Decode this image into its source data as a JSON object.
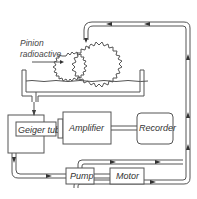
{
  "diagram": {
    "type": "schematic",
    "labels": {
      "pinion": "Pinion",
      "radioactive": "radioactive",
      "geiger": "Geiger tube",
      "amplifier": "Amplifier",
      "recorder": "Recorder",
      "pump": "Pump",
      "motor": "Motor"
    },
    "components": [
      {
        "id": "pinion",
        "label": "Pinion radioactive"
      },
      {
        "id": "gear",
        "label": ""
      },
      {
        "id": "oil-tank",
        "label": ""
      },
      {
        "id": "geiger-tube",
        "label": "Geiger tube"
      },
      {
        "id": "amplifier",
        "label": "Amplifier"
      },
      {
        "id": "recorder",
        "label": "Recorder"
      },
      {
        "id": "pump",
        "label": "Pump"
      },
      {
        "id": "motor",
        "label": "Motor"
      }
    ],
    "connections": [
      {
        "from": "oil-tank",
        "to": "geiger-tube"
      },
      {
        "from": "geiger-tube",
        "to": "amplifier"
      },
      {
        "from": "amplifier",
        "to": "recorder"
      },
      {
        "from": "geiger-tube",
        "to": "pump"
      },
      {
        "from": "motor",
        "to": "pump"
      },
      {
        "from": "pump",
        "to": "gear"
      }
    ],
    "colors": {
      "line": "#555555",
      "text": "#333333",
      "background": "#ffffff"
    }
  }
}
